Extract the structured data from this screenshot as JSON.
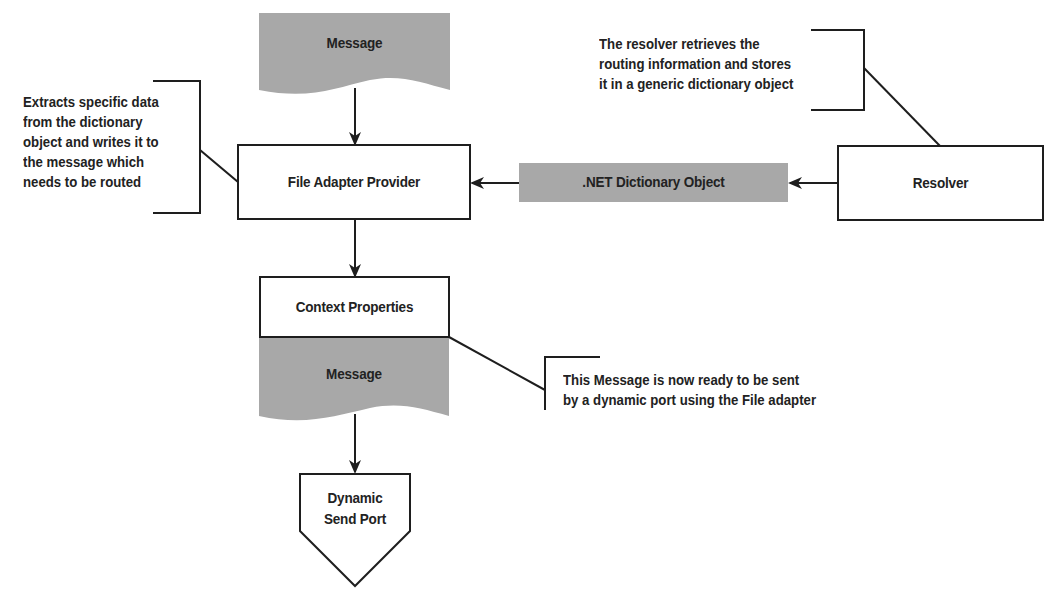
{
  "diagram": {
    "nodes": {
      "message_top": {
        "label": "Message",
        "shape": "document",
        "fill": "#a8a8a8"
      },
      "file_adapter_provider": {
        "label": "File Adapter Provider",
        "shape": "rectangle",
        "fill": "#ffffff"
      },
      "net_dictionary_object": {
        "label": ".NET Dictionary Object",
        "shape": "rectangle",
        "fill": "#a8a8a8"
      },
      "resolver": {
        "label": "Resolver",
        "shape": "rectangle",
        "fill": "#ffffff"
      },
      "context_properties": {
        "label": "Context Properties",
        "shape": "rectangle",
        "fill": "#ffffff"
      },
      "message_bottom": {
        "label": "Message",
        "shape": "document",
        "fill": "#a8a8a8"
      },
      "dynamic_send_port": {
        "label_line1": "Dynamic",
        "label_line2": "Send Port",
        "shape": "pentagon-down",
        "fill": "#ffffff"
      }
    },
    "edges": [
      {
        "from": "message_top",
        "to": "file_adapter_provider"
      },
      {
        "from": "resolver",
        "to": "net_dictionary_object"
      },
      {
        "from": "net_dictionary_object",
        "to": "file_adapter_provider"
      },
      {
        "from": "file_adapter_provider",
        "to": "context_properties"
      },
      {
        "from": "message_bottom",
        "to": "dynamic_send_port"
      }
    ],
    "annotations": {
      "provider_note": {
        "lines": [
          "Extracts specific data",
          "from the dictionary",
          "object and writes it to",
          "the message which",
          "needs to be routed"
        ],
        "target": "file_adapter_provider"
      },
      "resolver_note": {
        "lines": [
          "The resolver retrieves the",
          "routing information and stores",
          "it in a generic dictionary object"
        ],
        "target": "resolver"
      },
      "message_note": {
        "lines": [
          "This Message is now ready to be sent",
          "by a dynamic port using the File adapter"
        ],
        "target": "message_bottom"
      }
    },
    "colors": {
      "stroke": "#1e1e1e",
      "shaded": "#a8a8a8",
      "background": "#ffffff"
    }
  }
}
